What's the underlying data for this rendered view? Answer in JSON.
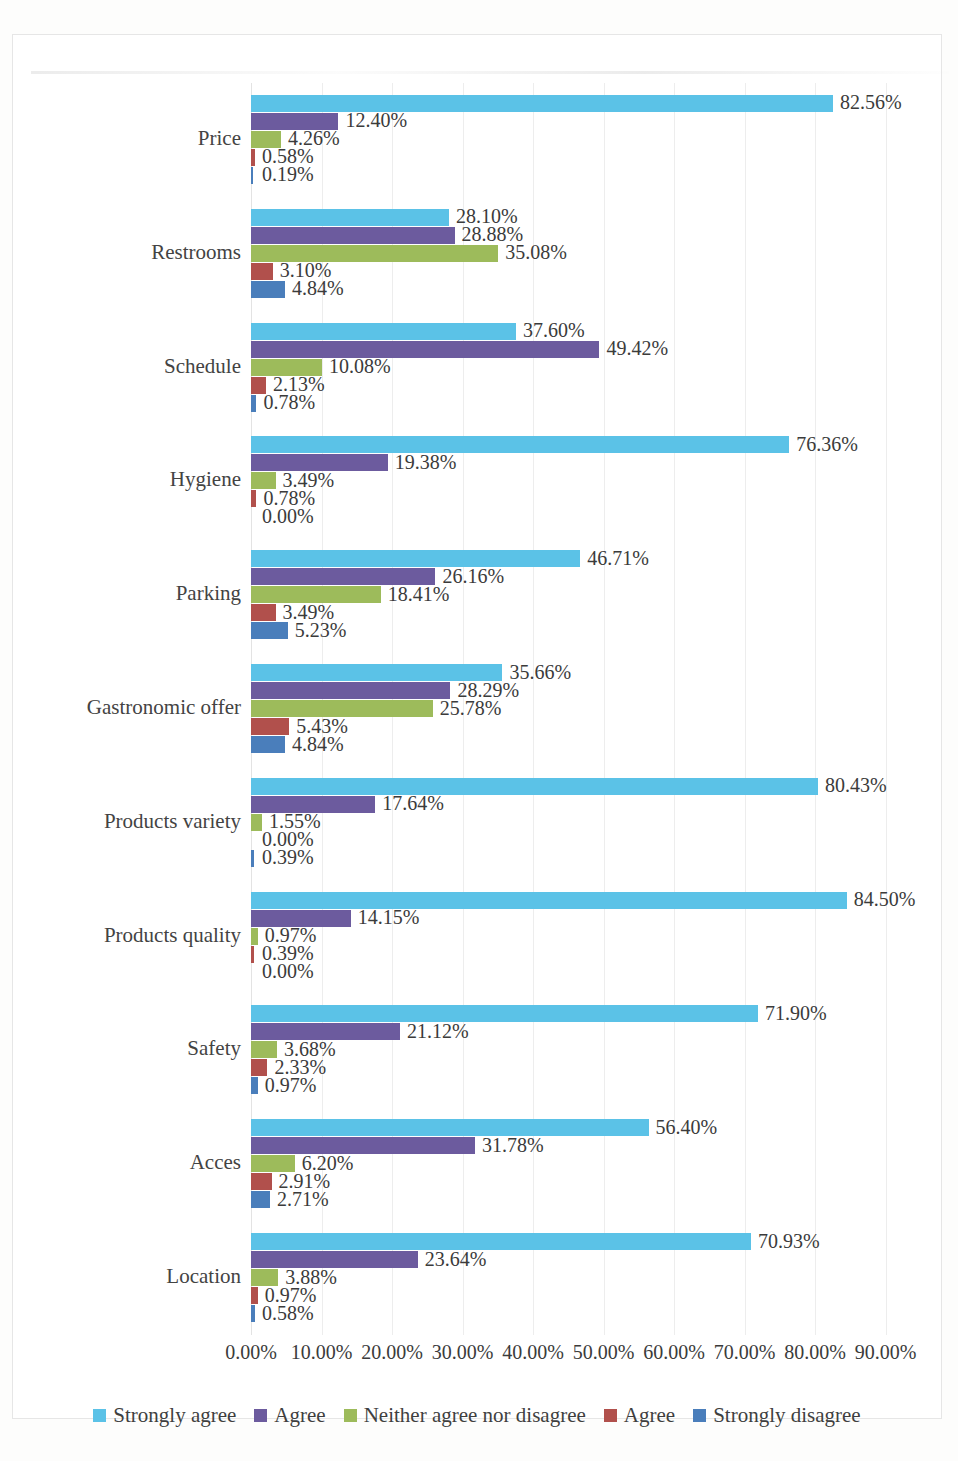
{
  "chart_data": {
    "type": "bar",
    "orientation": "horizontal",
    "title": "",
    "xlabel": "",
    "ylabel": "",
    "xlim": [
      0,
      100
    ],
    "xticks": [
      "0.00%",
      "10.00%",
      "20.00%",
      "30.00%",
      "40.00%",
      "50.00%",
      "60.00%",
      "70.00%",
      "80.00%",
      "90.00%"
    ],
    "xtick_values": [
      0,
      10,
      20,
      30,
      40,
      50,
      60,
      70,
      80,
      90
    ],
    "grid": true,
    "legend_position": "bottom",
    "value_label_format": "percent_2dp",
    "categories": [
      "Price",
      "Restrooms",
      "Schedule",
      "Hygiene",
      "Parking",
      "Gastronomic offer",
      "Products variety",
      "Products quality",
      "Safety",
      "Acces",
      "Location"
    ],
    "series": [
      {
        "name": "Strongly agree",
        "color": "#5BC2E7",
        "values": [
          82.56,
          28.1,
          37.6,
          76.36,
          46.71,
          35.66,
          80.43,
          84.5,
          71.9,
          56.4,
          70.93
        ],
        "labels": [
          "82.56%",
          "28.10%",
          "37.60%",
          "76.36%",
          "46.71%",
          "35.66%",
          "80.43%",
          "84.50%",
          "71.90%",
          "56.40%",
          "70.93%"
        ]
      },
      {
        "name": "Agree",
        "color": "#6C5B9E",
        "values": [
          12.4,
          28.88,
          49.42,
          19.38,
          26.16,
          28.29,
          17.64,
          14.15,
          21.12,
          31.78,
          23.64
        ],
        "labels": [
          "12.40%",
          "28.88%",
          "49.42%",
          "19.38%",
          "26.16%",
          "28.29%",
          "17.64%",
          "14.15%",
          "21.12%",
          "31.78%",
          "23.64%"
        ]
      },
      {
        "name": "Neither agree nor disagree",
        "color": "#9DBB5B",
        "values": [
          4.26,
          35.08,
          10.08,
          3.49,
          18.41,
          25.78,
          1.55,
          0.97,
          3.68,
          6.2,
          3.88
        ],
        "labels": [
          "4.26%",
          "35.08%",
          "10.08%",
          "3.49%",
          "18.41%",
          "25.78%",
          "1.55%",
          "0.97%",
          "3.68%",
          "6.20%",
          "3.88%"
        ]
      },
      {
        "name": "Agree",
        "color": "#B1504C",
        "values": [
          0.58,
          3.1,
          2.13,
          0.78,
          3.49,
          5.43,
          0.0,
          0.39,
          2.33,
          2.91,
          0.97
        ],
        "labels": [
          "0.58%",
          "3.10%",
          "2.13%",
          "0.78%",
          "3.49%",
          "5.43%",
          "0.00%",
          "0.39%",
          "2.33%",
          "2.91%",
          "0.97%"
        ]
      },
      {
        "name": "Strongly disagree",
        "color": "#4A7EBB",
        "values": [
          0.19,
          4.84,
          0.78,
          0.0,
          5.23,
          4.84,
          0.39,
          0.0,
          0.97,
          2.71,
          0.58
        ],
        "labels": [
          "0.19%",
          "4.84%",
          "0.78%",
          "0.00%",
          "5.23%",
          "4.84%",
          "0.39%",
          "0.00%",
          "0.97%",
          "2.71%",
          "0.58%"
        ]
      }
    ]
  },
  "legend": {
    "items": [
      {
        "label": "Strongly agree",
        "color": "#5BC2E7"
      },
      {
        "label": "Agree",
        "color": "#6C5B9E"
      },
      {
        "label": "Neither agree nor disagree",
        "color": "#9DBB5B"
      },
      {
        "label": "Agree",
        "color": "#B1504C"
      },
      {
        "label": "Strongly disagree",
        "color": "#4A7EBB"
      }
    ]
  }
}
